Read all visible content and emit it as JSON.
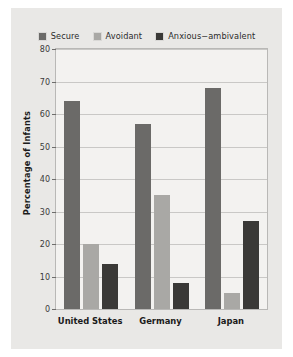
{
  "chart_data": {
    "type": "bar",
    "title": "",
    "xlabel": "",
    "ylabel": "Percentage of Infants",
    "ylim": [
      0,
      80
    ],
    "ytick_step": 10,
    "yticks": [
      "0",
      "10",
      "20",
      "30",
      "40",
      "50",
      "60",
      "70",
      "80"
    ],
    "grid": true,
    "legend_position": "top",
    "categories": [
      "United States",
      "Germany",
      "Japan"
    ],
    "series": [
      {
        "name": "Secure",
        "color": "#6b6a68",
        "values": [
          64,
          57,
          68
        ]
      },
      {
        "name": "Avoidant",
        "color": "#a9a8a5",
        "values": [
          20,
          35,
          5
        ]
      },
      {
        "name": "Anxious−ambivalent",
        "color": "#3a3937",
        "values": [
          14,
          8,
          27
        ]
      }
    ]
  },
  "colors": {
    "figure_background": "#e9e8e6",
    "plot_background": "#f3f2f0",
    "plot_border": "#b9b8b6",
    "gridline": "#c9c8c6",
    "text": "#1b1b1b"
  }
}
